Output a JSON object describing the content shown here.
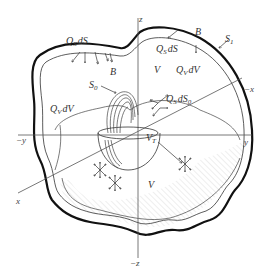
{
  "figure": {
    "axes": {
      "z": "z",
      "neg_z": "−z",
      "y": "y",
      "neg_y": "−y",
      "x": "x",
      "neg_x": "−x"
    },
    "labels": {
      "qs_ds_top_left": {
        "main": "Q",
        "sub": "S",
        "rest": "dS"
      },
      "qs_ds_top_right": {
        "main": "Q",
        "sub": "S",
        "rest": "dS"
      },
      "b_left": "B",
      "b_right": "B",
      "s1": {
        "main": "S",
        "sub": "1"
      },
      "s0": {
        "main": "S",
        "sub": "0"
      },
      "v_top": "V",
      "qv_dv_right": {
        "main": "Q",
        "sub": "V",
        "rest": "dV"
      },
      "qv_dv_left": {
        "main": "Q",
        "sub": "V",
        "rest": "dV"
      },
      "qs_ds0": {
        "main": "Q",
        "sub": "S",
        "rest": "dS",
        "rest_sub": "0"
      },
      "vt": {
        "main": "V",
        "sub": "T"
      },
      "v_bottom": "V"
    },
    "colors": {
      "outline": "#111111",
      "line": "#333333",
      "hatch": "#cfcfcf",
      "background": "#ffffff"
    }
  }
}
